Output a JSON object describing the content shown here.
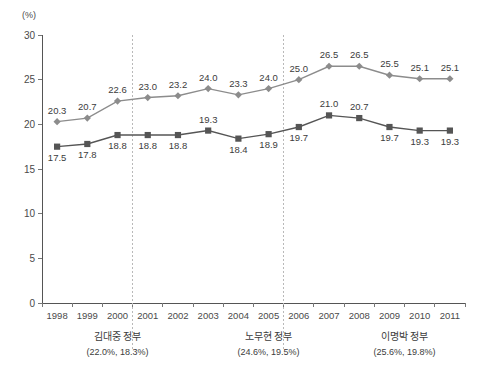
{
  "chart_data": {
    "type": "line",
    "title": "",
    "xlabel": "",
    "ylabel": "(%)",
    "unit_label": "(%)",
    "grid": false,
    "legend_position": "none",
    "ylim": [
      0,
      30
    ],
    "yticks": [
      0,
      5,
      10,
      15,
      20,
      25,
      30
    ],
    "ytick_labels": [
      "0",
      "5",
      "10",
      "15",
      "20",
      "25",
      "30"
    ],
    "categories": [
      "1998",
      "1999",
      "2000",
      "2001",
      "2002",
      "2003",
      "2004",
      "2005",
      "2006",
      "2007",
      "2008",
      "2009",
      "2010",
      "2011"
    ],
    "series": [
      {
        "name": "upper-series",
        "marker": "diamond",
        "color": "#8c8c8c",
        "values": [
          20.3,
          20.7,
          22.6,
          23.0,
          23.2,
          24.0,
          23.3,
          24.0,
          25.0,
          26.5,
          26.5,
          25.5,
          25.1,
          25.1
        ],
        "labels": [
          "20.3",
          "20.7",
          "22.6",
          "23.0",
          "23.2",
          "24.0",
          "23.3",
          "24.0",
          "25.0",
          "26.5",
          "26.5",
          "25.5",
          "25.1",
          "25.1"
        ]
      },
      {
        "name": "lower-series",
        "marker": "square",
        "color": "#555555",
        "values": [
          17.5,
          17.8,
          18.8,
          18.8,
          18.8,
          19.3,
          18.4,
          18.9,
          19.7,
          21.0,
          20.7,
          19.7,
          19.3,
          19.3
        ],
        "labels": [
          "17.5",
          "17.8",
          "18.8",
          "18.8",
          "18.8",
          "19.3",
          "18.4",
          "18.9",
          "19.7",
          "21.0",
          "20.7",
          "19.7",
          "19.3",
          "19.3"
        ]
      }
    ],
    "annotations": [
      {
        "name": "김대중 정부",
        "stats": "(22.0%, 18.3%)",
        "start_year": "1998",
        "end_year": "2002"
      },
      {
        "name": "노무현 정부",
        "stats": "(24.6%, 19.5%)",
        "start_year": "2003",
        "end_year": "2007"
      },
      {
        "name": "이명박 정부",
        "stats": "(25.6%, 19.8%)",
        "start_year": "2008",
        "end_year": "2011"
      }
    ],
    "dividers": [
      2.5,
      7.5
    ],
    "colors": {
      "upper_series": "#8c8c8c",
      "lower_series": "#555555",
      "axis": "#555555",
      "divider": "#b9b9b9",
      "text": "#3c3c3c"
    }
  }
}
